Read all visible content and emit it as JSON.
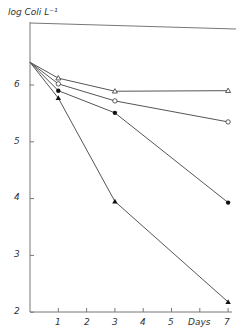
{
  "chart_data": {
    "type": "line",
    "title": "",
    "xlabel": "Days",
    "ylabel": "log Coli L⁻¹",
    "xlim": [
      0,
      7.2
    ],
    "ylim": [
      2,
      6.8
    ],
    "grid": false,
    "legend": "none",
    "x_ticks": [
      "1",
      "2",
      "3",
      "4",
      "5",
      "Days",
      "7"
    ],
    "y_ticks": [
      "2",
      "3",
      "4",
      "5",
      "6"
    ],
    "x": [
      0,
      1,
      3,
      7
    ],
    "series": [
      {
        "name": "open triangle",
        "marker": "triangle-open",
        "values": [
          6.4,
          6.12,
          5.89,
          5.9
        ]
      },
      {
        "name": "open circle",
        "marker": "circle-open",
        "values": [
          6.4,
          6.02,
          5.72,
          5.35
        ]
      },
      {
        "name": "filled circle",
        "marker": "circle-filled",
        "values": [
          6.4,
          5.9,
          5.51,
          3.93
        ]
      },
      {
        "name": "filled triangle",
        "marker": "triangle-filled",
        "values": [
          6.4,
          5.77,
          3.95,
          2.18
        ]
      }
    ]
  },
  "labels": {
    "ylabel": "log Coli L⁻¹",
    "xlabel": "Days",
    "yticks": [
      "6",
      "5",
      "4",
      "3",
      "2"
    ],
    "xticks": [
      "1",
      "2",
      "3",
      "4",
      "5",
      "7"
    ]
  }
}
